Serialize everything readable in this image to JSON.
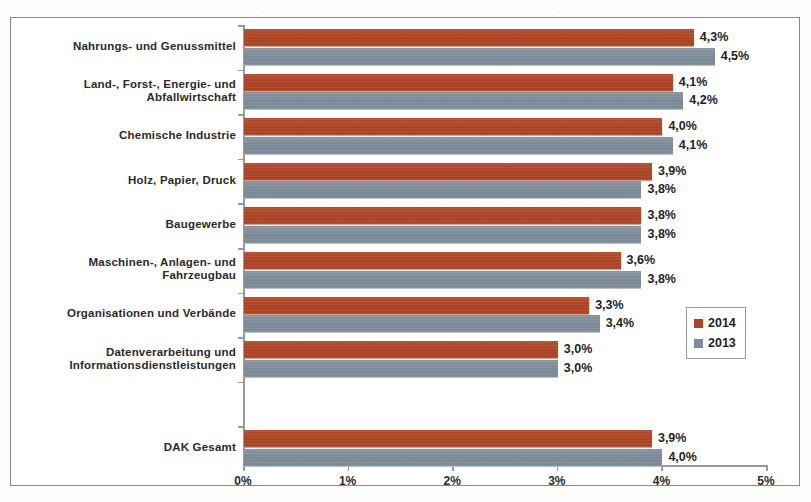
{
  "chart_data": {
    "type": "bar",
    "orientation": "horizontal",
    "title": "",
    "xlabel": "",
    "ylabel": "",
    "xlim": [
      0,
      5
    ],
    "xtick_labels": [
      "0%",
      "1%",
      "2%",
      "3%",
      "4%",
      "5%"
    ],
    "xtick_values": [
      0,
      1,
      2,
      3,
      4,
      5
    ],
    "grid": false,
    "legend_position": "right",
    "value_suffix": "%",
    "decimal_separator": ",",
    "categories": [
      "Nahrungs- und Genussmittel",
      "Land-, Forst-, Energie- und\nAbfallwirtschaft",
      "Chemische Industrie",
      "Holz, Papier, Druck",
      "Baugewerbe",
      "Maschinen-, Anlagen- und\nFahrzeugbau",
      "Organisationen und Verbände",
      "Datenverarbeitung und\nInformationsdienstleistungen",
      "",
      "DAK Gesamt"
    ],
    "series": [
      {
        "name": "2014",
        "color": "#ad4526",
        "values": [
          4.3,
          4.1,
          4.0,
          3.9,
          3.8,
          3.6,
          3.3,
          3.0,
          null,
          3.9
        ],
        "labels": [
          "4,3%",
          "4,1%",
          "4,0%",
          "3,9%",
          "3,8%",
          "3,6%",
          "3,3%",
          "3,0%",
          "",
          "3,9%"
        ]
      },
      {
        "name": "2013",
        "color": "#7d8b98",
        "values": [
          4.5,
          4.2,
          4.1,
          3.8,
          3.8,
          3.8,
          3.4,
          3.0,
          null,
          4.0
        ],
        "labels": [
          "4,5%",
          "4,2%",
          "4,1%",
          "3,8%",
          "3,8%",
          "3,8%",
          "3,4%",
          "3,0%",
          "",
          "4,0%"
        ]
      }
    ]
  },
  "legend": {
    "entries": [
      {
        "label": "2014",
        "color": "#ad4526"
      },
      {
        "label": "2013",
        "color": "#7d8b98"
      }
    ]
  },
  "colors": {
    "series_2014": "#ad4526",
    "series_2013": "#7d8b98",
    "axis": "#9a9a9a",
    "frame": "#8a8a8a",
    "text": "#2b2b2b",
    "background": "#ffffff"
  }
}
